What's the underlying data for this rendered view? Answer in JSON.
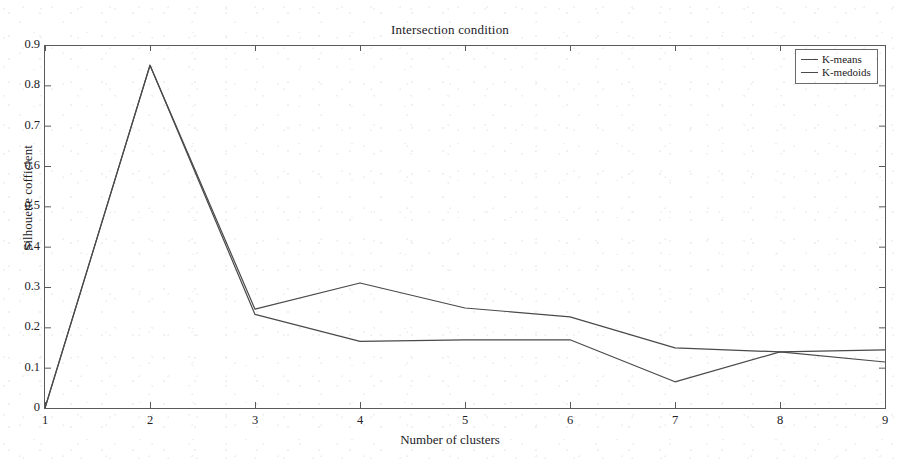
{
  "chart_data": {
    "type": "line",
    "title": "Intersection condition",
    "xlabel": "Number of clusters",
    "ylabel": "Silhouette cofficient",
    "x": [
      1,
      2,
      3,
      4,
      5,
      6,
      7,
      8,
      9
    ],
    "xtick_labels": [
      "1",
      "2",
      "3",
      "4",
      "5",
      "6",
      "7",
      "8",
      "9"
    ],
    "ytick_labels": [
      "0",
      "0.1",
      "0.2",
      "0.3",
      "0.4",
      "0.5",
      "0.6",
      "0.7",
      "0.8",
      "0.9"
    ],
    "ytick_values": [
      0,
      0.1,
      0.2,
      0.3,
      0.4,
      0.5,
      0.6,
      0.7,
      0.8,
      0.9
    ],
    "xlim": [
      1,
      9
    ],
    "ylim": [
      0,
      0.9
    ],
    "grid": false,
    "legend_position": "top-right",
    "series": [
      {
        "name": "K-means",
        "color": "#4a4a4a",
        "values": [
          0,
          0.85,
          0.245,
          0.31,
          0.248,
          0.226,
          0.149,
          0.139,
          0.144
        ]
      },
      {
        "name": "K-medoids",
        "color": "#4a4a4a",
        "values": [
          0,
          0.85,
          0.232,
          0.165,
          0.169,
          0.169,
          0.065,
          0.139,
          0.114
        ]
      }
    ]
  },
  "axes": {
    "box_color": "#5a5a5a",
    "background": "#ffffff"
  }
}
